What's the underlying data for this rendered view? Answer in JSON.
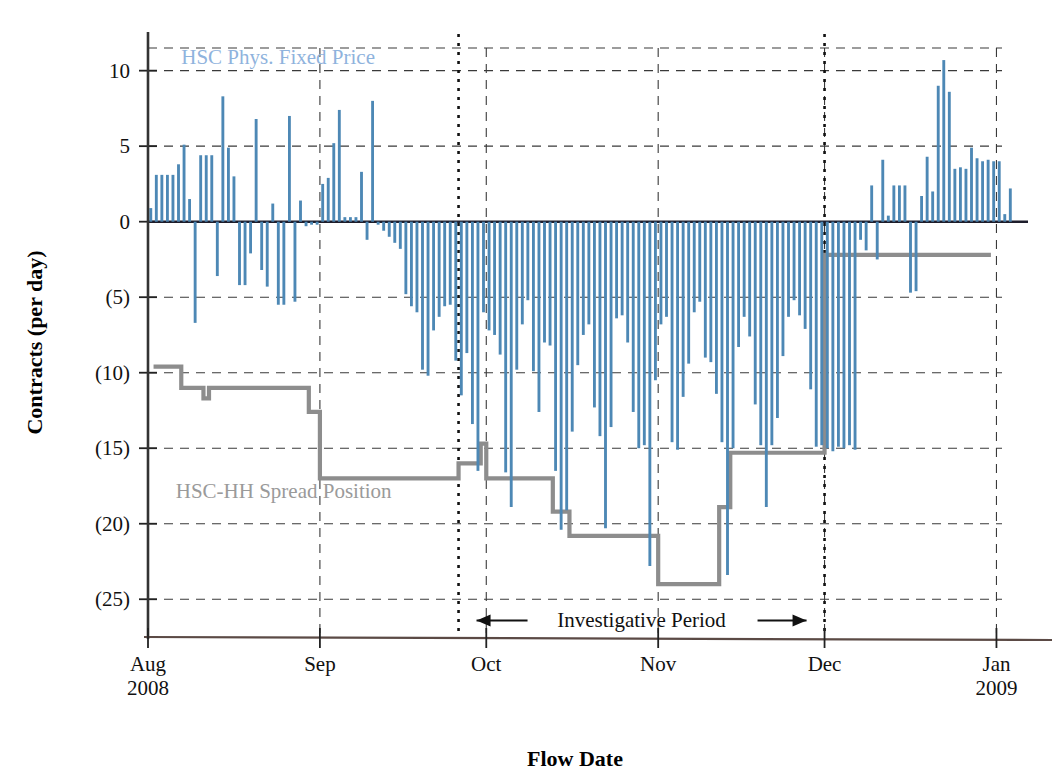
{
  "chart_data": {
    "type": "bar",
    "title": "",
    "xlabel": "Flow Date",
    "ylabel": "Contracts (per day)",
    "ylim": [
      -27.5,
      11.5
    ],
    "ytick_values": [
      10,
      5,
      0,
      -5,
      -10,
      -15,
      -20,
      -25
    ],
    "ytick_labels": [
      "10",
      "5",
      "0",
      "(5)",
      "(10)",
      "(15)",
      "(20)",
      "(25)"
    ],
    "grid": true,
    "legend_position": "inside-plot",
    "xtick_labels": [
      {
        "month": "Aug",
        "year": "2008"
      },
      {
        "month": "Sep",
        "year": ""
      },
      {
        "month": "Oct",
        "year": ""
      },
      {
        "month": "Nov",
        "year": ""
      },
      {
        "month": "Dec",
        "year": ""
      },
      {
        "month": "Jan",
        "year": "2009"
      }
    ],
    "xlim_days": [
      0,
      154
    ],
    "month_start_days": [
      0,
      31,
      61,
      92,
      122,
      153
    ],
    "annotations": [
      {
        "name": "investigative-period",
        "text": "Investigative Period",
        "start_day": 56,
        "end_day": 122,
        "y": -26.4
      }
    ],
    "series": [
      {
        "name": "HSC Phys. Fixed Price",
        "type": "bar",
        "color": "#4d88b5",
        "label_x_day": 6,
        "label_y": 10.9,
        "values": [
          0.9,
          3.1,
          3.1,
          3.1,
          3.1,
          3.8,
          5.1,
          1.5,
          -6.7,
          4.4,
          4.4,
          4.4,
          -3.6,
          8.3,
          4.9,
          3.0,
          -4.2,
          -4.2,
          -2.1,
          6.8,
          -3.2,
          -4.3,
          1.2,
          -5.5,
          -5.5,
          7.0,
          -5.3,
          1.4,
          -0.3,
          -0.2,
          -0.2,
          2.5,
          2.9,
          5.2,
          7.4,
          0.3,
          0.3,
          0.3,
          3.3,
          -1.2,
          8.0,
          -0.2,
          -0.6,
          -1.0,
          -1.4,
          -1.8,
          -4.8,
          -5.6,
          -6.0,
          -9.8,
          -10.2,
          -7.2,
          -6.3,
          -5.6,
          -5.5,
          -9.2,
          -11.5,
          -8.7,
          -13.4,
          -16.5,
          -6.0,
          -7.2,
          -7.5,
          -8.8,
          -16.6,
          -18.9,
          -9.8,
          -6.8,
          -5.2,
          -9.9,
          -12.6,
          -8.0,
          -8.2,
          -16.5,
          -20.4,
          -19.1,
          -13.9,
          -9.5,
          -7.5,
          -6.8,
          -12.3,
          -14.2,
          -20.3,
          -13.6,
          -6.4,
          -6.2,
          -8.0,
          -12.6,
          -15.0,
          -14.8,
          -22.8,
          -10.5,
          -6.8,
          -6.3,
          -14.6,
          -15.1,
          -11.6,
          -9.4,
          -6.0,
          -5.3,
          -9.0,
          -9.3,
          -11.4,
          -14.6,
          -23.4,
          -15.0,
          -8.3,
          -6.3,
          -7.6,
          -12.1,
          -14.8,
          -18.9,
          -14.8,
          -13.0,
          -8.9,
          -6.3,
          -5.2,
          -6.2,
          -7.1,
          -11.1,
          -14.9,
          -14.8,
          -15.0,
          -15.2,
          -14.9,
          -15.0,
          -14.8,
          -15.1,
          -1.2,
          -1.9,
          2.4,
          -2.5,
          4.1,
          0.4,
          2.4,
          2.4,
          2.4,
          -4.7,
          -4.6,
          1.7,
          4.3,
          2.0,
          9.0,
          10.7,
          8.6,
          3.5,
          3.6,
          3.5,
          4.9,
          4.2,
          4.0,
          4.1,
          4.0,
          4.0,
          0.5,
          2.2
        ]
      },
      {
        "name": "HSC-HH Spread Position",
        "type": "step",
        "color": "#8d8d8d",
        "label_x_day": 5,
        "label_y": -17.8,
        "points": [
          {
            "day": 1,
            "value": -9.6
          },
          {
            "day": 6,
            "value": -9.6
          },
          {
            "day": 6,
            "value": -11.0
          },
          {
            "day": 10,
            "value": -11.0
          },
          {
            "day": 10,
            "value": -11.7
          },
          {
            "day": 11,
            "value": -11.7
          },
          {
            "day": 11,
            "value": -11.0
          },
          {
            "day": 29,
            "value": -11.0
          },
          {
            "day": 29,
            "value": -12.6
          },
          {
            "day": 31,
            "value": -12.6
          },
          {
            "day": 31,
            "value": -17.0
          },
          {
            "day": 56,
            "value": -17.0
          },
          {
            "day": 56,
            "value": -16.0
          },
          {
            "day": 60,
            "value": -16.0
          },
          {
            "day": 60,
            "value": -14.7
          },
          {
            "day": 61,
            "value": -14.7
          },
          {
            "day": 61,
            "value": -17.0
          },
          {
            "day": 73,
            "value": -17.0
          },
          {
            "day": 73,
            "value": -19.2
          },
          {
            "day": 76,
            "value": -19.2
          },
          {
            "day": 76,
            "value": -20.8
          },
          {
            "day": 92,
            "value": -20.8
          },
          {
            "day": 92,
            "value": -24.0
          },
          {
            "day": 103,
            "value": -24.0
          },
          {
            "day": 103,
            "value": -18.9
          },
          {
            "day": 105,
            "value": -18.9
          },
          {
            "day": 105,
            "value": -15.3
          },
          {
            "day": 122,
            "value": -15.3
          },
          {
            "day": 122,
            "value": -2.2
          },
          {
            "day": 152,
            "value": -2.2
          }
        ]
      }
    ],
    "vertical_markers": [
      {
        "name": "investigative-start",
        "day": 56,
        "style": "dotted"
      },
      {
        "name": "investigative-end",
        "day": 122,
        "style": "dotted"
      }
    ]
  }
}
